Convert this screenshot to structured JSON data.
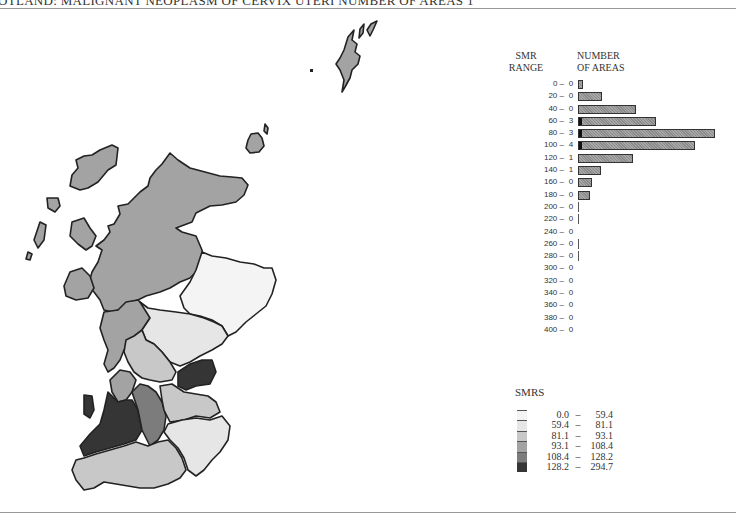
{
  "title": "OTLAND: MALIGNANT NEOPLASM OF CERVIX UTERI NUMBER OF AREAS 1",
  "histogram": {
    "header_left": [
      "SMR",
      "RANGE"
    ],
    "header_right": [
      "NUMBER",
      "OF AREAS"
    ]
  },
  "legend": {
    "title": "SMRS",
    "classes": [
      {
        "lo": "0.0",
        "hi": "59.4",
        "color": "#f4f4f4"
      },
      {
        "lo": "59.4",
        "hi": "81.1",
        "color": "#e6e6e6"
      },
      {
        "lo": "81.1",
        "hi": "93.1",
        "color": "#c8c8c8"
      },
      {
        "lo": "93.1",
        "hi": "108.4",
        "color": "#a3a3a3"
      },
      {
        "lo": "108.4",
        "hi": "128.2",
        "color": "#7c7c7c"
      },
      {
        "lo": "128.2",
        "hi": "294.7",
        "color": "#353535"
      }
    ]
  },
  "chart_data": [
    {
      "type": "bar",
      "orientation": "horizontal",
      "title": "SMR RANGE / NUMBER OF AREAS",
      "xlabel": "NUMBER OF AREAS",
      "ylabel": "SMR RANGE",
      "categories": [
        "0 –",
        "20 –",
        "40 –",
        "60 –",
        "80 –",
        "100 –",
        "120 –",
        "140 –",
        "160 –",
        "180 –",
        "200 –",
        "220 –",
        "240 –",
        "260 –",
        "280 –",
        "300 –",
        "320 –",
        "340 –",
        "360 –",
        "380 –",
        "400 –"
      ],
      "count_labels": [
        0,
        0,
        0,
        3,
        3,
        4,
        1,
        1,
        0,
        0,
        0,
        0,
        0,
        0,
        0,
        0,
        0,
        0,
        0,
        0,
        0
      ],
      "bar_lengths_px": [
        5,
        24,
        58,
        78,
        137,
        117,
        55,
        23,
        14,
        12,
        1,
        1,
        0,
        1,
        1,
        0,
        0,
        0,
        0,
        0,
        0
      ],
      "dark_marker": [
        false,
        false,
        false,
        true,
        true,
        true,
        false,
        false,
        false,
        false,
        false,
        false,
        false,
        false,
        false,
        false,
        false,
        false,
        false,
        false,
        false
      ]
    },
    {
      "type": "map",
      "title": "Scotland SMR choropleth",
      "legend_title": "SMRS",
      "classes": [
        "0.0 – 59.4",
        "59.4 – 81.1",
        "81.1 – 93.1",
        "93.1 – 108.4",
        "108.4 – 128.2",
        "128.2 – 294.7"
      ]
    }
  ]
}
